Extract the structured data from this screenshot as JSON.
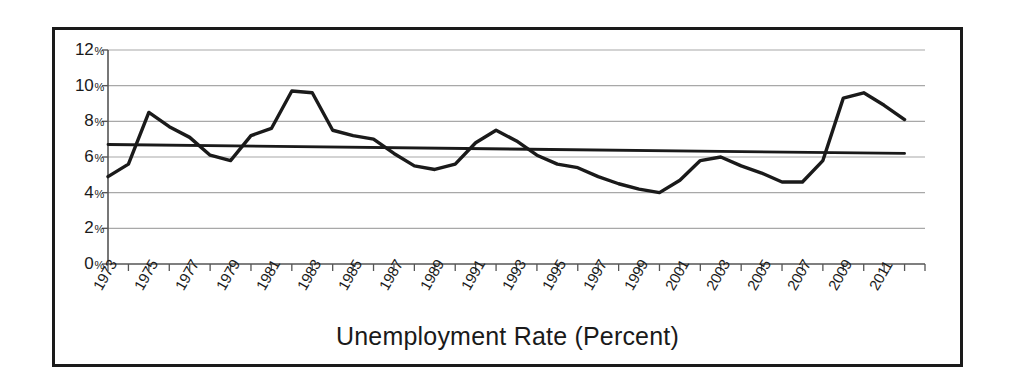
{
  "chart_data": {
    "type": "line",
    "title": "",
    "xlabel": "Unemployment Rate (Percent)",
    "ylabel": "",
    "xlim": [
      1973,
      2013
    ],
    "ylim": [
      0,
      12
    ],
    "grid": true,
    "legend": "none",
    "y_ticks": [
      0,
      2,
      4,
      6,
      8,
      10,
      12
    ],
    "y_tick_labels": [
      "0%",
      "2%",
      "4%",
      "6%",
      "8%",
      "10%",
      "12%"
    ],
    "y_tick_number_labels": [
      "0",
      "2",
      "4",
      "6",
      "8",
      "10",
      "12"
    ],
    "y_tick_suffix": "%",
    "x_ticks": [
      1973,
      1974,
      1975,
      1976,
      1977,
      1978,
      1979,
      1980,
      1981,
      1982,
      1983,
      1984,
      1985,
      1986,
      1987,
      1988,
      1989,
      1990,
      1991,
      1992,
      1993,
      1994,
      1995,
      1996,
      1997,
      1998,
      1999,
      2000,
      2001,
      2002,
      2003,
      2004,
      2005,
      2006,
      2007,
      2008,
      2009,
      2010,
      2011,
      2012,
      2013
    ],
    "x_tick_labels": [
      "1973",
      "1975",
      "1977",
      "1979",
      "1981",
      "1983",
      "1985",
      "1987",
      "1989",
      "1991",
      "1993",
      "1995",
      "1997",
      "1999",
      "2001",
      "2003",
      "2005",
      "2007",
      "2009",
      "2011"
    ],
    "x_tick_label_years": [
      1973,
      1975,
      1977,
      1979,
      1981,
      1983,
      1985,
      1987,
      1989,
      1991,
      1993,
      1995,
      1997,
      1999,
      2001,
      2003,
      2005,
      2007,
      2009,
      2011
    ],
    "series": [
      {
        "name": "Unemployment Rate",
        "color": "#1a1a1a",
        "x": [
          1973,
          1974,
          1975,
          1976,
          1977,
          1978,
          1979,
          1980,
          1981,
          1982,
          1983,
          1984,
          1985,
          1986,
          1987,
          1988,
          1989,
          1990,
          1991,
          1992,
          1993,
          1994,
          1995,
          1996,
          1997,
          1998,
          1999,
          2000,
          2001,
          2002,
          2003,
          2004,
          2005,
          2006,
          2007,
          2008,
          2009,
          2010,
          2011,
          2012
        ],
        "values": [
          4.9,
          5.6,
          8.5,
          7.7,
          7.1,
          6.1,
          5.8,
          7.2,
          7.6,
          9.7,
          9.6,
          7.5,
          7.2,
          7.0,
          6.2,
          5.5,
          5.3,
          5.6,
          6.8,
          7.5,
          6.9,
          6.1,
          5.6,
          5.4,
          4.9,
          4.5,
          4.2,
          4.0,
          4.7,
          5.8,
          6.0,
          5.5,
          5.1,
          4.6,
          4.6,
          5.8,
          9.3,
          9.6,
          8.9,
          8.1
        ]
      },
      {
        "name": "Trend Line",
        "color": "#1a1a1a",
        "x": [
          1973,
          2012
        ],
        "values": [
          6.7,
          6.2
        ]
      }
    ]
  },
  "figure": {
    "axis_title": "Unemployment Rate (Percent)",
    "border_color": "#1a1a1a",
    "grid_color": "#a8a8a8",
    "line_color": "#1a1a1a",
    "background": "#ffffff"
  }
}
